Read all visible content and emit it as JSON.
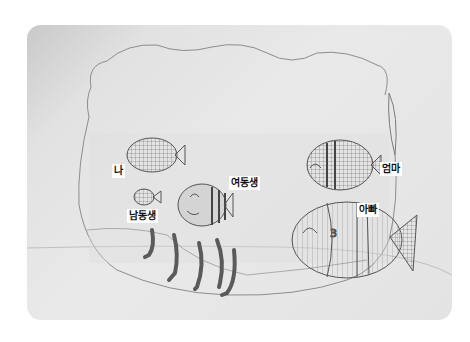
{
  "image": {
    "description": "Child's pencil drawing of a fishbowl with five fish representing family members",
    "background_color": "#e6e6e6",
    "pencil_color": "#555555"
  },
  "labels": {
    "me": "나",
    "younger_brother": "남동생",
    "younger_sister": "여동생",
    "mom": "엄마",
    "dad": "아빠"
  }
}
